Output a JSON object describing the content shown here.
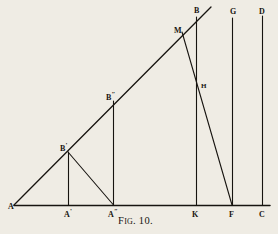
{
  "figure": {
    "caption_lead": "F",
    "caption_smallcaps": "IG",
    "caption_tail": ". 10.",
    "caption_full": "FIG. 10.",
    "background_color": "#efece4",
    "ink_color": "#171410",
    "width": 278,
    "height": 234
  },
  "labels": [
    {
      "id": "A",
      "text": "A",
      "prime": "",
      "x": 8,
      "y": 200
    },
    {
      "id": "A-prime",
      "text": "A",
      "prime": "'",
      "x": 64,
      "y": 208
    },
    {
      "id": "A-second",
      "text": "A",
      "prime": "″",
      "x": 108,
      "y": 208
    },
    {
      "id": "K",
      "text": "K",
      "prime": "",
      "x": 192,
      "y": 208
    },
    {
      "id": "F",
      "text": "F",
      "prime": "",
      "x": 229,
      "y": 208
    },
    {
      "id": "C",
      "text": "C",
      "prime": "",
      "x": 259,
      "y": 208
    },
    {
      "id": "B-prime",
      "text": "B",
      "prime": "'",
      "x": 60,
      "y": 142
    },
    {
      "id": "B-second",
      "text": "B",
      "prime": "″",
      "x": 106,
      "y": 91
    },
    {
      "id": "M",
      "text": "M",
      "prime": "",
      "x": 174,
      "y": 24
    },
    {
      "id": "B",
      "text": "B",
      "prime": "",
      "x": 194,
      "y": 4
    },
    {
      "id": "G",
      "text": "G",
      "prime": "",
      "x": 230,
      "y": 5
    },
    {
      "id": "D",
      "text": "D",
      "prime": "",
      "x": 259,
      "y": 5
    },
    {
      "id": "H",
      "text": "H",
      "prime": "",
      "x": 201,
      "y": 80
    }
  ],
  "geometry": {
    "baseline": {
      "name": "baseline-AC",
      "x1": 14,
      "y1": 205,
      "x2": 270,
      "y2": 205
    },
    "hypotenuse": {
      "name": "ray-AB",
      "x1": 14,
      "y1": 205,
      "x2": 211,
      "y2": 7
    },
    "verticals": [
      {
        "name": "perpendicular-A-prime-B-prime",
        "x": 68,
        "y1": 205,
        "y2": 152
      },
      {
        "name": "perpendicular-A-second-B-second",
        "x": 113,
        "y1": 205,
        "y2": 101
      },
      {
        "name": "perpendicular-K-B",
        "x": 196,
        "y1": 205,
        "y2": 17
      },
      {
        "name": "perpendicular-F-G",
        "x": 232,
        "y1": 205,
        "y2": 18
      },
      {
        "name": "perpendicular-C-D",
        "x": 262,
        "y1": 205,
        "y2": 16
      }
    ],
    "obliques": [
      {
        "name": "segment-B-prime-A-second",
        "x1": 68,
        "y1": 152,
        "x2": 113,
        "y2": 205
      },
      {
        "name": "segment-M-F",
        "x1": 182,
        "y1": 32,
        "x2": 232,
        "y2": 205
      }
    ]
  },
  "caption_position": {
    "x": 118,
    "y": 215
  }
}
